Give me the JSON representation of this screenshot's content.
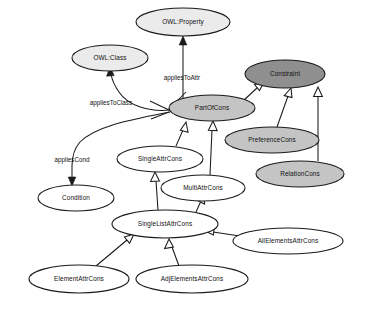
{
  "diagram": {
    "type": "uml-class-ontology",
    "background_color": "#ffffff",
    "line_color": "#1a1a1a",
    "fills": {
      "white": "#ffffff",
      "light_gray": "#ebebeb",
      "mid_gray": "#c4c4c4",
      "dark_gray": "#8f8f8f"
    },
    "nodes": [
      {
        "id": "owl_property",
        "label": "OWL:Property",
        "cx": 183,
        "cy": 22,
        "rx": 47,
        "ry": 14,
        "fill": "light_gray"
      },
      {
        "id": "owl_class",
        "label": "OWL:Class",
        "cx": 110,
        "cy": 58,
        "rx": 38,
        "ry": 13,
        "fill": "light_gray"
      },
      {
        "id": "constraint",
        "label": "Constraint",
        "cx": 285,
        "cy": 74,
        "rx": 40,
        "ry": 14,
        "fill": "dark_gray"
      },
      {
        "id": "part_of_cons",
        "label": "PartOfCons",
        "cx": 212,
        "cy": 108,
        "rx": 43,
        "ry": 13,
        "fill": "mid_gray"
      },
      {
        "id": "preference_cons",
        "label": "PreferenceCons",
        "cx": 272,
        "cy": 140,
        "rx": 47,
        "ry": 13,
        "fill": "mid_gray"
      },
      {
        "id": "relation_cons",
        "label": "RelationCons",
        "cx": 300,
        "cy": 174,
        "rx": 44,
        "ry": 13,
        "fill": "mid_gray"
      },
      {
        "id": "single_attr_cons",
        "label": "SingleAttrCons",
        "cx": 160,
        "cy": 159,
        "rx": 43,
        "ry": 13,
        "fill": "white"
      },
      {
        "id": "multi_attr_cons",
        "label": "MultiAttrCons",
        "cx": 203,
        "cy": 188,
        "rx": 42,
        "ry": 13,
        "fill": "white"
      },
      {
        "id": "condition",
        "label": "Condition",
        "cx": 76,
        "cy": 198,
        "rx": 38,
        "ry": 13,
        "fill": "white"
      },
      {
        "id": "single_list_attr",
        "label": "SingleListAttrCons",
        "cx": 165,
        "cy": 224,
        "rx": 53,
        "ry": 14,
        "fill": "white"
      },
      {
        "id": "all_elements_attr",
        "label": "AllElementsAttrCons",
        "cx": 288,
        "cy": 241,
        "rx": 55,
        "ry": 13,
        "fill": "white"
      },
      {
        "id": "element_attr_cons",
        "label": "ElementAttrCons",
        "cx": 79,
        "cy": 279,
        "rx": 50,
        "ry": 14,
        "fill": "white"
      },
      {
        "id": "adj_elements_attr",
        "label": "AdjElementsAttrCons",
        "cx": 192,
        "cy": 279,
        "rx": 56,
        "ry": 14,
        "fill": "white"
      }
    ],
    "edge_labels": [
      {
        "id": "applies_to_attr",
        "label": "appliesToAttr",
        "x": 182,
        "y": 78
      },
      {
        "id": "applies_to_class",
        "label": "appliesToClass",
        "x": 111,
        "y": 103
      },
      {
        "id": "applies_cond",
        "label": "appliesCond",
        "x": 72,
        "y": 160
      }
    ],
    "relationships": [
      {
        "from": "part_of_cons",
        "to": "owl_property",
        "kind": "association",
        "label": "appliesToAttr"
      },
      {
        "from": "part_of_cons",
        "to": "owl_class",
        "kind": "association",
        "label": "appliesToClass"
      },
      {
        "from": "part_of_cons",
        "to": "condition",
        "kind": "association",
        "label": "appliesCond"
      },
      {
        "from": "part_of_cons",
        "to": "constraint",
        "kind": "generalization"
      },
      {
        "from": "preference_cons",
        "to": "constraint",
        "kind": "generalization"
      },
      {
        "from": "relation_cons",
        "to": "constraint",
        "kind": "generalization"
      },
      {
        "from": "single_attr_cons",
        "to": "part_of_cons",
        "kind": "generalization"
      },
      {
        "from": "multi_attr_cons",
        "to": "part_of_cons",
        "kind": "generalization"
      },
      {
        "from": "single_list_attr",
        "to": "single_attr_cons",
        "kind": "generalization"
      },
      {
        "from": "single_list_attr",
        "to": "multi_attr_cons",
        "kind": "generalization"
      },
      {
        "from": "element_attr_cons",
        "to": "single_list_attr",
        "kind": "generalization"
      },
      {
        "from": "adj_elements_attr",
        "to": "single_list_attr",
        "kind": "generalization"
      },
      {
        "from": "all_elements_attr",
        "to": "single_list_attr",
        "kind": "generalization"
      }
    ]
  }
}
